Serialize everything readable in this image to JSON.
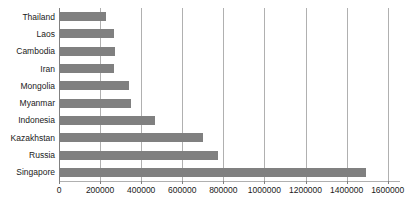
{
  "chart_data": {
    "type": "bar",
    "orientation": "horizontal",
    "title": "",
    "xlabel": "",
    "ylabel": "",
    "categories": [
      "Thailand",
      "Laos",
      "Cambodia",
      "Iran",
      "Mongolia",
      "Myanmar",
      "Indonesia",
      "Kazakhstan",
      "Russia",
      "Singapore"
    ],
    "values": [
      230000,
      270000,
      275000,
      270000,
      340000,
      350000,
      467000,
      700000,
      773000,
      1493000
    ],
    "xlim": [
      0,
      1660000
    ],
    "xticks": [
      0,
      200000,
      400000,
      600000,
      800000,
      1000000,
      1200000,
      1400000,
      1600000
    ],
    "xticklabels": [
      "0",
      "200000",
      "400000",
      "600000",
      "800000",
      "1000000",
      "1200000",
      "1400000",
      "1600000"
    ],
    "grid": true,
    "grid_axis": "x",
    "legend": false,
    "bar_color": "#808080",
    "gridline_color": "#b0b0b0",
    "axis_color": "#808080",
    "background_color": "#ffffff",
    "text_color": "#1a1a1a"
  }
}
